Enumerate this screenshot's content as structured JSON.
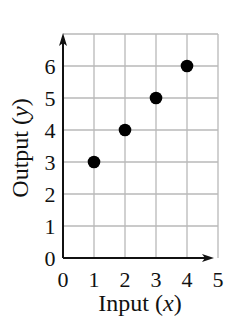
{
  "chart_data": {
    "type": "scatter",
    "title": "",
    "xlabel": "Input",
    "xlabel_var": "x",
    "ylabel": "Output",
    "ylabel_var": "y",
    "xlim": [
      0,
      5
    ],
    "ylim": [
      0,
      7
    ],
    "grid": true,
    "x_ticks": [
      0,
      1,
      2,
      3,
      4,
      5
    ],
    "y_ticks": [
      0,
      1,
      2,
      3,
      4,
      5,
      6
    ],
    "x_tick_labels": [
      "0",
      "1",
      "2",
      "3",
      "4",
      "5"
    ],
    "y_tick_labels": [
      "0",
      "1",
      "2",
      "3",
      "4",
      "5",
      "6"
    ],
    "series": [
      {
        "name": "points",
        "x": [
          1,
          2,
          3,
          4
        ],
        "y": [
          3,
          4,
          5,
          6
        ]
      }
    ],
    "colors": {
      "point": "#000000",
      "grid": "#b8b8b8",
      "axis": "#111111"
    }
  }
}
